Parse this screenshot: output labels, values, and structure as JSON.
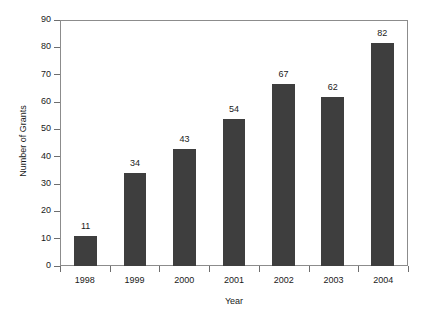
{
  "chart_data": {
    "type": "bar",
    "title": "",
    "subtitle": "",
    "xlabel": "Year",
    "ylabel": "Number of Grants",
    "categories": [
      "1998",
      "1999",
      "2000",
      "2001",
      "2002",
      "2003",
      "2004"
    ],
    "values": [
      11,
      34,
      43,
      54,
      67,
      62,
      82
    ],
    "value_labels": [
      "11",
      "34",
      "43",
      "54",
      "67",
      "62",
      "82"
    ],
    "series": [
      {
        "name": "Number of Grants",
        "values": [
          11,
          34,
          43,
          54,
          67,
          62,
          82
        ]
      }
    ],
    "ylim": [
      0,
      90
    ],
    "ytick_values": [
      0,
      10,
      20,
      30,
      40,
      50,
      60,
      70,
      80,
      90
    ],
    "ytick_labels": [
      "0",
      "10",
      "20",
      "30",
      "40",
      "50",
      "60",
      "70",
      "80",
      "90"
    ],
    "ytick_interval": 10,
    "xtick_labels": [
      "1998",
      "1999",
      "2000",
      "2001",
      "2002",
      "2003",
      "2004"
    ],
    "grid": false,
    "legend": false,
    "legend_position": "none",
    "bar_color": "#3e3e3e",
    "frame_color": "#8c8c8c",
    "background_color": "#ffffff",
    "text_color": "#1a1a1a",
    "data_labels_shown": true
  }
}
